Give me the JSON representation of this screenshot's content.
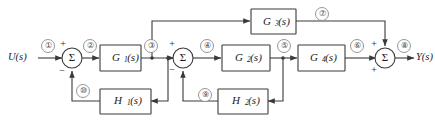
{
  "diagram": {
    "type": "control-system-block-diagram",
    "input": {
      "label": "U(s)"
    },
    "output": {
      "label": "Y(s)"
    },
    "blocks": [
      {
        "id": "G1",
        "base": "G",
        "sub": "1",
        "arg": "(s)",
        "label": "G1(s)"
      },
      {
        "id": "G2",
        "base": "G",
        "sub": "2",
        "arg": "(s)",
        "label": "G2(s)"
      },
      {
        "id": "G3",
        "base": "G",
        "sub": "3",
        "arg": "(s)",
        "label": "G3(s)"
      },
      {
        "id": "G4",
        "base": "G",
        "sub": "4",
        "arg": "(s)",
        "label": "G4(s)"
      },
      {
        "id": "H1",
        "base": "H",
        "sub": "1",
        "arg": "(s)",
        "label": "H1(s)"
      },
      {
        "id": "H2",
        "base": "H",
        "sub": "2",
        "arg": "(s)",
        "label": "H2(s)"
      }
    ],
    "summers": [
      {
        "id": "sum1",
        "glyph": "Σ",
        "signs": {
          "top": "+",
          "bottom": "−"
        }
      },
      {
        "id": "sum2",
        "glyph": "Σ",
        "signs": {
          "top": "+",
          "bottom": "−"
        }
      },
      {
        "id": "sum3",
        "glyph": "Σ",
        "signs": {
          "top": "+",
          "bottom": "+"
        }
      }
    ],
    "signal_tags": [
      {
        "id": "t1",
        "text": "①"
      },
      {
        "id": "t2",
        "text": "②"
      },
      {
        "id": "t3",
        "text": "③"
      },
      {
        "id": "t4",
        "text": "④"
      },
      {
        "id": "t5",
        "text": "⑤"
      },
      {
        "id": "t6",
        "text": "⑥"
      },
      {
        "id": "t7",
        "text": "⑦"
      },
      {
        "id": "t8",
        "text": "⑧"
      },
      {
        "id": "t9",
        "text": "⑨"
      },
      {
        "id": "t10",
        "text": "⑩"
      }
    ],
    "colors": {
      "line": "#3a3a3a",
      "text": "#1a1a1a",
      "tag_outline": "#8a8a8a",
      "background": "#ffffff"
    }
  }
}
